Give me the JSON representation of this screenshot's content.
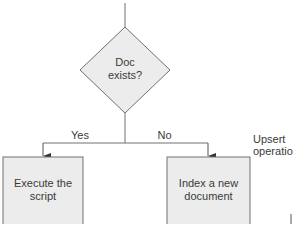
{
  "diagram": {
    "type": "flowchart",
    "nodes": {
      "decision": {
        "shape": "diamond",
        "line1": "Doc",
        "line2": "exists?"
      },
      "yes_action": {
        "shape": "rectangle",
        "line1": "Execute the",
        "line2": "script"
      },
      "no_action": {
        "shape": "rectangle",
        "line1": "Index a new",
        "line2": "document"
      }
    },
    "edges": {
      "yes_label": "Yes",
      "no_label": "No"
    },
    "annotation": {
      "line1": "Upsert",
      "line2": "operation"
    },
    "colors": {
      "node_fill": "#ececec",
      "stroke": "#707070",
      "text": "#3a3a3a"
    }
  }
}
